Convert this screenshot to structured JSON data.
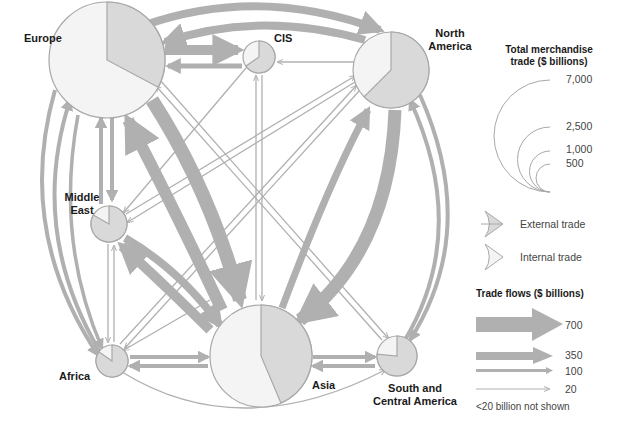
{
  "regions": [
    {
      "id": "europe",
      "name": "Europe",
      "cx": 107,
      "cy": 60,
      "r": 58,
      "external_start": 0,
      "external_end": 118
    },
    {
      "id": "cis",
      "name": "CIS",
      "cx": 259,
      "cy": 57,
      "r": 16,
      "external_start": 0,
      "external_end": 235,
      "invert": true
    },
    {
      "id": "north_america",
      "name": "North America",
      "cx": 391,
      "cy": 70,
      "r": 38,
      "external_start": 0,
      "external_end": 225
    },
    {
      "id": "middle_east",
      "name": "Middle East",
      "cx": 109,
      "cy": 224,
      "r": 18,
      "external_start": 0,
      "external_end": 300,
      "invert": true
    },
    {
      "id": "africa",
      "name": "Africa",
      "cx": 112,
      "cy": 361,
      "r": 16,
      "external_start": 0,
      "external_end": 305,
      "invert": true
    },
    {
      "id": "asia",
      "name": "Asia",
      "cx": 261,
      "cy": 356,
      "r": 51,
      "external_start": 0,
      "external_end": 157
    },
    {
      "id": "south_central_america",
      "name": "South and Central America",
      "cx": 397,
      "cy": 356,
      "r": 20,
      "external_start": 0,
      "external_end": 275,
      "invert": true
    }
  ],
  "labels": {
    "europe": "Europe",
    "cis": "CIS",
    "north_america_1": "North",
    "north_america_2": "America",
    "middle_east_1": "Middle",
    "middle_east_2": "East",
    "africa": "Africa",
    "asia": "Asia",
    "sca_1": "South and",
    "sca_2": "Central America"
  },
  "legend": {
    "size_title_1": "Total merchandise",
    "size_title_2": "trade ($ billions)",
    "sizes": [
      "7,000",
      "2,500",
      "1,000",
      "500"
    ],
    "external_label": "External trade",
    "internal_label": "Internal trade",
    "flows_title": "Trade flows ($ billions)",
    "flows": [
      "700",
      "350",
      "100",
      "20"
    ],
    "note": "<20 billion not shown"
  },
  "colors": {
    "flow": "#b0b0b0",
    "external": "#d9d9d9",
    "internal": "#f4f4f4",
    "outline": "#a8a8a8",
    "text": "#1a1a1a"
  },
  "chart_data": {
    "type": "flow-diagram",
    "nodes": [
      "Europe",
      "CIS",
      "North America",
      "Middle East",
      "Africa",
      "Asia",
      "South and Central America"
    ],
    "size_scale_billions": [
      7000,
      2500,
      1000,
      500
    ],
    "flow_scale_billions": [
      700,
      350,
      100,
      20
    ],
    "flows_approx_billions": [
      {
        "from": "Europe",
        "to": "North America",
        "value": 350
      },
      {
        "from": "North America",
        "to": "Europe",
        "value": 300
      },
      {
        "from": "Europe",
        "to": "CIS",
        "value": 200
      },
      {
        "from": "CIS",
        "to": "Europe",
        "value": 100
      },
      {
        "from": "Europe",
        "to": "Asia",
        "value": 600
      },
      {
        "from": "Asia",
        "to": "Europe",
        "value": 650
      },
      {
        "from": "Asia",
        "to": "North America",
        "value": 300
      },
      {
        "from": "North America",
        "to": "Asia",
        "value": 700
      },
      {
        "from": "Middle East",
        "to": "Asia",
        "value": 500
      },
      {
        "from": "Asia",
        "to": "Middle East",
        "value": 200
      },
      {
        "from": "Europe",
        "to": "Middle East",
        "value": 100
      },
      {
        "from": "Middle East",
        "to": "Europe",
        "value": 100
      },
      {
        "from": "Europe",
        "to": "Africa",
        "value": 150
      },
      {
        "from": "Africa",
        "to": "Europe",
        "value": 150
      },
      {
        "from": "North America",
        "to": "South and Central America",
        "value": 150
      },
      {
        "from": "South and Central America",
        "to": "North America",
        "value": 150
      },
      {
        "from": "Asia",
        "to": "Africa",
        "value": 100
      },
      {
        "from": "Africa",
        "to": "Asia",
        "value": 100
      },
      {
        "from": "Asia",
        "to": "South and Central America",
        "value": 100
      },
      {
        "from": "South and Central America",
        "to": "Asia",
        "value": 100
      }
    ],
    "notes": "<20 billion not shown"
  }
}
